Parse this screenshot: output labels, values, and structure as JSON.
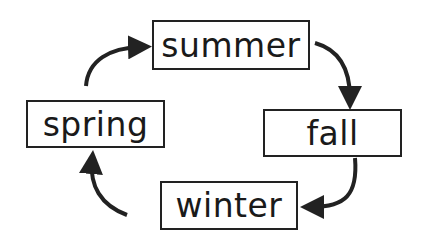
{
  "diagram": {
    "type": "cycle",
    "nodes": [
      {
        "id": "summer",
        "label": "summer"
      },
      {
        "id": "fall",
        "label": "fall"
      },
      {
        "id": "winter",
        "label": "winter"
      },
      {
        "id": "spring",
        "label": "spring"
      }
    ],
    "edges": [
      {
        "from": "summer",
        "to": "fall"
      },
      {
        "from": "fall",
        "to": "winter"
      },
      {
        "from": "winter",
        "to": "spring"
      },
      {
        "from": "spring",
        "to": "summer"
      }
    ],
    "colors": {
      "stroke": "#222222",
      "background": "#ffffff"
    }
  }
}
